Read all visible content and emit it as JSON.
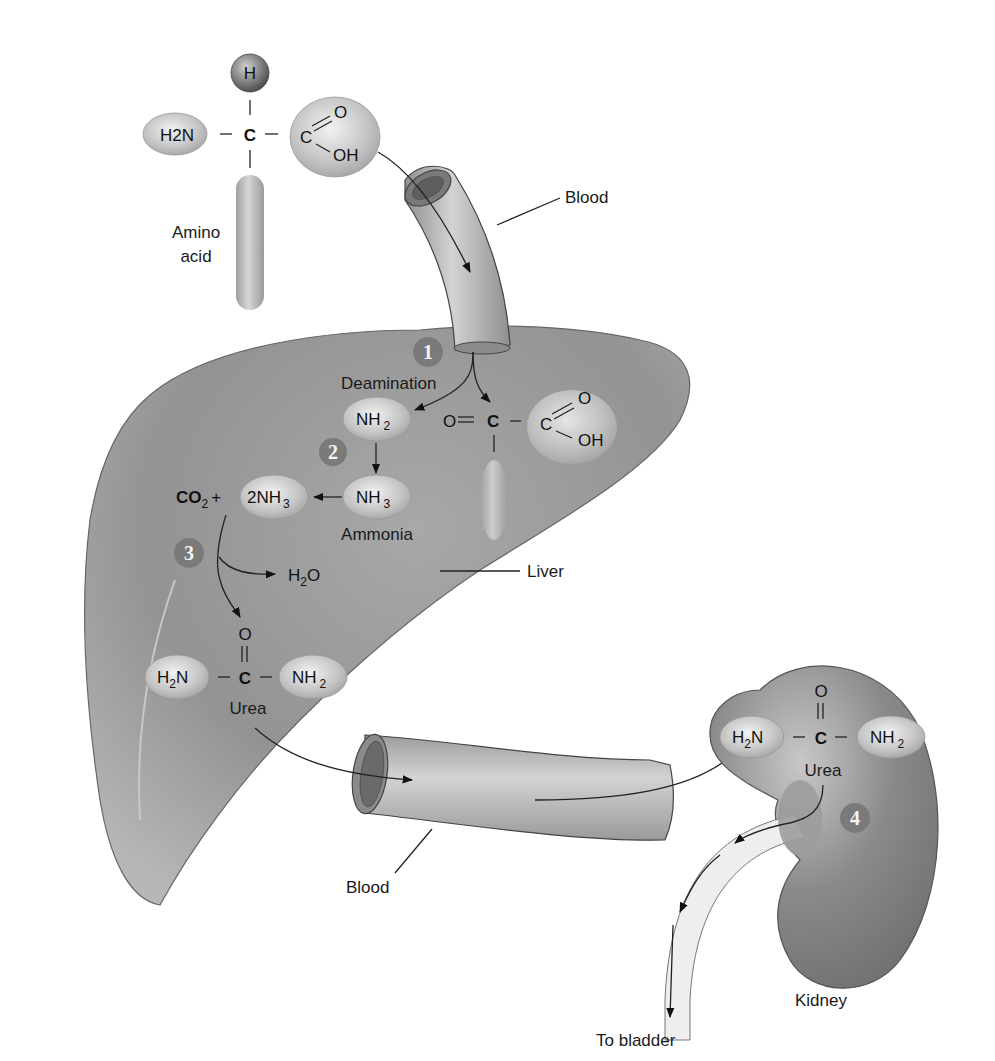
{
  "diagram": {
    "amino_acid": {
      "label_line1": "Amino",
      "label_line2": "acid",
      "h": "H",
      "c": "C",
      "amino_group": "H2N",
      "carboxyl_c": "C",
      "carboxyl_o": "O",
      "carboxyl_oh": "OH"
    },
    "labels": {
      "blood_top": "Blood",
      "blood_bottom": "Blood",
      "liver": "Liver",
      "kidney": "Kidney",
      "to_bladder": "To bladder",
      "deamination": "Deamination",
      "ammonia": "Ammonia",
      "urea_liver": "Urea",
      "urea_kidney": "Urea"
    },
    "steps": [
      {
        "number": "1",
        "name": "Deamination"
      },
      {
        "number": "2",
        "name": "NH2 to NH3 (Ammonia)"
      },
      {
        "number": "3",
        "name": "CO2 + 2NH3 to Urea + H2O"
      },
      {
        "number": "4",
        "name": "Urea excreted by kidney"
      }
    ],
    "chem": {
      "nh2": "NH",
      "nh3": "NH",
      "two_nh3": "2NH",
      "co2": "CO",
      "plus": "+",
      "h2o_h": "H",
      "h2o_o": "O",
      "keto_o": "O",
      "keto_c": "C",
      "urea_o": "O",
      "urea_c": "C",
      "h2n": "H",
      "n": "N",
      "sub2": "2",
      "sub3": "3"
    },
    "colors": {
      "organ_gray": "#8f8f8f",
      "bubble": "#c9c9c9",
      "step_circle": "#7a7a7a",
      "text": "#1a1a1a"
    }
  }
}
